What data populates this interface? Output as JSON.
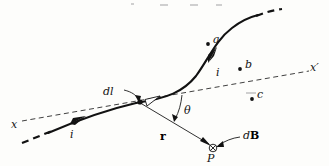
{
  "figure": {
    "name": "biot-savart-current-element-diagram",
    "background_color": "#fdfdfb",
    "ink_color": "#121212",
    "width": 329,
    "height": 166
  },
  "labels": {
    "axis_left": "x",
    "axis_right": "x′",
    "current_lower": "i",
    "current_upper": "i",
    "element": "dl",
    "radius_vector": "r",
    "angle": "θ",
    "field": "dB",
    "point": "P",
    "point_a": "a",
    "point_b": "b",
    "point_c": "c"
  },
  "elements": {
    "wire": {
      "name": "current-carrying-wire",
      "style": "solid-curved-with-dashed-breaks"
    },
    "axis": {
      "name": "x-x-prime-axis",
      "style": "dashed-straight-line"
    },
    "r_vector": {
      "name": "r-vector-arrow",
      "from": "current-element",
      "to": "field-point-P"
    },
    "angle_arc": {
      "name": "theta-angle-arc",
      "between": [
        "x-axis",
        "r-vector"
      ]
    },
    "field_marker": {
      "name": "into-page-symbol",
      "glyph": "circled-cross"
    }
  },
  "field_points": [
    {
      "name": "point-a",
      "label": "a",
      "x": 208,
      "y": 44
    },
    {
      "name": "point-b",
      "label": "b",
      "x": 240,
      "y": 69
    },
    {
      "name": "point-c",
      "label": "c",
      "x": 252,
      "y": 99
    }
  ]
}
